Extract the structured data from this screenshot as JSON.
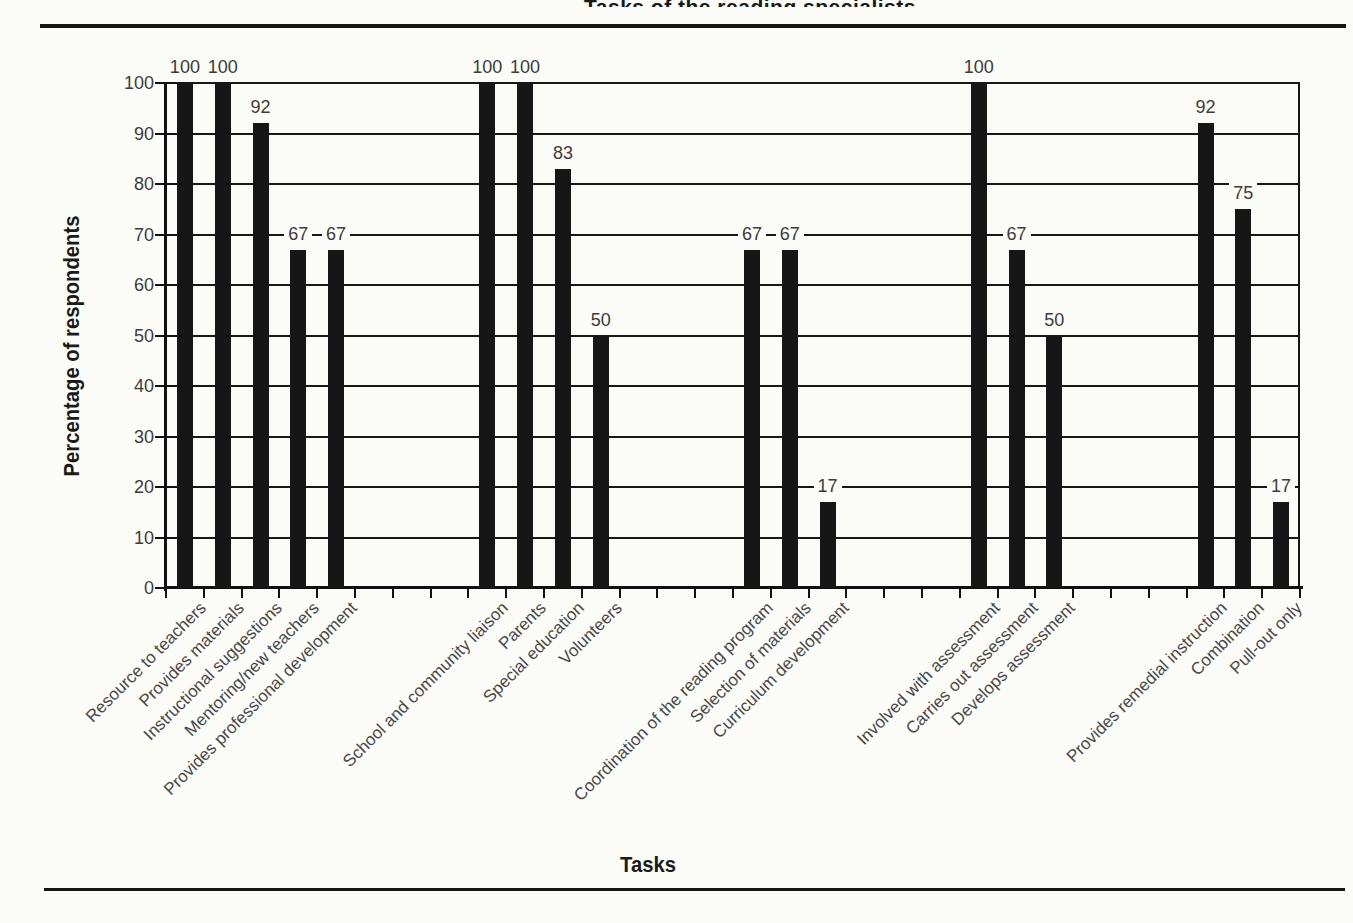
{
  "figure": {
    "cropped_title_fragment": "Tasks of the reading specialists",
    "x_axis_title": "Tasks",
    "y_axis_title": "Percentage of respondents"
  },
  "chart_data": {
    "type": "bar",
    "title": "Tasks of the reading specialists",
    "title_visibility": "cropped at top edge, only bottom sliver of letters visible",
    "xlabel": "Tasks",
    "ylabel": "Percentage of respondents",
    "ylim": [
      0,
      100
    ],
    "ytick_step": 10,
    "yticks": [
      0,
      10,
      20,
      30,
      40,
      50,
      60,
      70,
      80,
      90,
      100
    ],
    "grid": true,
    "legend": false,
    "bar_color": "#161616",
    "value_labels": true,
    "total_slots": 30,
    "groups": [
      {
        "start_slot": 0,
        "categories": [
          "Resource to teachers",
          "Provides materials",
          "Instructional suggestions",
          "Mentoring/new teachers",
          "Provides professional development"
        ],
        "values": [
          100,
          100,
          92,
          67,
          67
        ]
      },
      {
        "start_slot": 8,
        "categories": [
          "School and community liaison",
          "Parents",
          "Special education",
          "Volunteers"
        ],
        "values": [
          100,
          100,
          83,
          50
        ]
      },
      {
        "start_slot": 15,
        "categories": [
          "Coordination of the reading program",
          "Selection of materials",
          "Curriculum development"
        ],
        "values": [
          67,
          67,
          17
        ]
      },
      {
        "start_slot": 21,
        "categories": [
          "Involved with assessment",
          "Carries out assessment",
          "Develops assessment"
        ],
        "values": [
          100,
          67,
          50
        ]
      },
      {
        "start_slot": 27,
        "categories": [
          "Provides remedial instruction",
          "Combination",
          "Pull-out only"
        ],
        "values": [
          92,
          75,
          17
        ]
      }
    ]
  }
}
